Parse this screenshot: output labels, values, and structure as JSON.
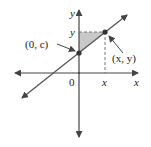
{
  "diagram": {
    "type": "coordinate-plane-line",
    "axes": {
      "x_label": "x",
      "y_label": "y",
      "origin_label": "0"
    },
    "points": {
      "intercept": {
        "label": "(0, c)"
      },
      "general": {
        "label": "(x, y)"
      }
    },
    "guides": {
      "x_tick_label": "x",
      "y_tick_label": "y"
    },
    "colors": {
      "line": "#555555",
      "axis": "#444444",
      "shade": "#c8c8c8",
      "point": "#333333"
    }
  }
}
